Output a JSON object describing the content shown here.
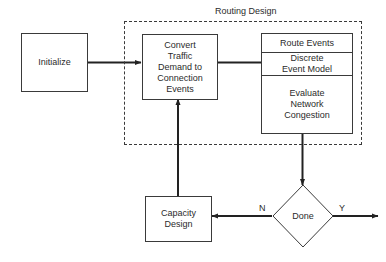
{
  "diagram": {
    "title": "Routing Design",
    "type": "flowchart",
    "background_color": "#ffffff",
    "line_color": "#3a3a3a",
    "text_color": "#2b2b2b"
  },
  "group": {
    "label": "Routing Design",
    "style": "dashed"
  },
  "nodes": {
    "initialize": {
      "label": "Initialize",
      "shape": "rect"
    },
    "convert": {
      "label": "Convert\nTraffic\nDemand to\nConnection\nEvents",
      "shape": "rect"
    },
    "capacity_design": {
      "label": "Capacity\nDesign",
      "shape": "rect"
    },
    "done": {
      "label": "Done",
      "shape": "diamond"
    }
  },
  "stack": {
    "cells": [
      {
        "label": "Route Events"
      },
      {
        "label": "Discrete\nEvent Model"
      },
      {
        "label": "Evaluate\nNetwork\nCongestion"
      }
    ]
  },
  "edges": {
    "yes_label": "Y",
    "no_label": "N"
  }
}
